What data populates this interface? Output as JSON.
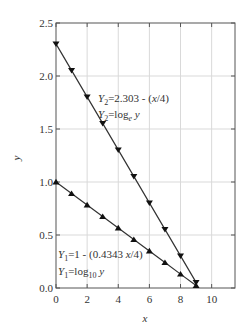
{
  "chart_data": {
    "type": "line",
    "title": "",
    "xlabel": "x",
    "ylabel": "y",
    "xlim": [
      0,
      11.5
    ],
    "ylim": [
      0,
      2.5
    ],
    "xticks": [
      0,
      2,
      4,
      6,
      8,
      10
    ],
    "xtick_labels": [
      "0",
      "2",
      "4",
      "6",
      "8",
      "10"
    ],
    "yticks": [
      0.0,
      0.5,
      1.0,
      1.5,
      2.0,
      2.5
    ],
    "ytick_labels": [
      "0.0",
      "0.5",
      "1.0",
      "1.5",
      "2.0",
      "2.5"
    ],
    "grid": true,
    "legend": "none (inline annotations)",
    "x": [
      0,
      1,
      2,
      3,
      4,
      5,
      6,
      7,
      8,
      9
    ],
    "series": [
      {
        "name": "Y2 = 2.303 - (x/4), Y2 = log_e y",
        "marker": "triangle-down",
        "values": [
          2.303,
          2.053,
          1.803,
          1.553,
          1.303,
          1.053,
          0.803,
          0.553,
          0.303,
          0.053
        ]
      },
      {
        "name": "Y1 = 1 - (0.4343 x/4), Y1 = log10 y",
        "marker": "triangle-up",
        "values": [
          1.0,
          0.891,
          0.783,
          0.674,
          0.566,
          0.457,
          0.349,
          0.24,
          0.131,
          0.023
        ]
      }
    ],
    "annotations": [
      {
        "line1": {
          "lhs": "Y",
          "sub": "2",
          "rhs_pre": "=2.303 - (",
          "rhs_it": "x",
          "rhs_post": "/4)"
        },
        "line2": {
          "lhs": "Y",
          "sub": "2",
          "rhs_pre": "=log",
          "rhs_sub": "e",
          "rhs_it": " y"
        }
      },
      {
        "line1": {
          "lhs": "Y",
          "sub": "1",
          "rhs_pre": "=1 - (0.4343 ",
          "rhs_it": "x",
          "rhs_post": "/4)"
        },
        "line2": {
          "lhs": "Y",
          "sub": "1",
          "rhs_pre": "=log",
          "rhs_sub": "10",
          "rhs_it": " y"
        }
      }
    ]
  },
  "colors": {
    "line": "#333333",
    "grid": "#d9d9d9",
    "axis": "#555555"
  }
}
